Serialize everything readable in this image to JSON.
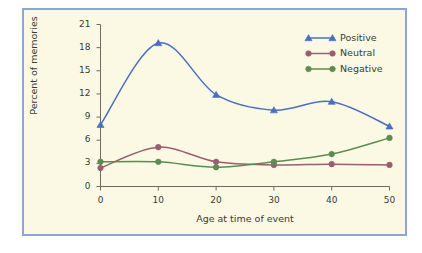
{
  "figure": {
    "background_color": "#fbf9e4",
    "border_color": "#8ea6d4",
    "page_color": "#ffffff"
  },
  "chart_data": {
    "type": "line",
    "title": "",
    "subtitle": "",
    "xlabel": "Age at time of event",
    "ylabel": "Percent of memories",
    "x": [
      0,
      10,
      20,
      30,
      40,
      50
    ],
    "xticks": [
      "0",
      "10",
      "20",
      "30",
      "40",
      "50"
    ],
    "yticks": [
      "0",
      "3",
      "6",
      "9",
      "12",
      "15",
      "18",
      "21"
    ],
    "xlim": [
      0,
      50
    ],
    "ylim": [
      0,
      21
    ],
    "grid": false,
    "legend_position": "upper-right",
    "smoothing": "spline",
    "series": [
      {
        "name": "Positive",
        "color": "#4a6fc0",
        "marker": "triangle",
        "values": [
          8.0,
          18.6,
          11.9,
          9.9,
          11.0,
          7.8
        ]
      },
      {
        "name": "Neutral",
        "color": "#9b5d70",
        "marker": "circle",
        "values": [
          2.4,
          5.1,
          3.2,
          2.8,
          2.9,
          2.8
        ]
      },
      {
        "name": "Negative",
        "color": "#5b8c52",
        "marker": "circle",
        "values": [
          3.2,
          3.2,
          2.5,
          3.2,
          4.2,
          6.3
        ]
      }
    ]
  }
}
